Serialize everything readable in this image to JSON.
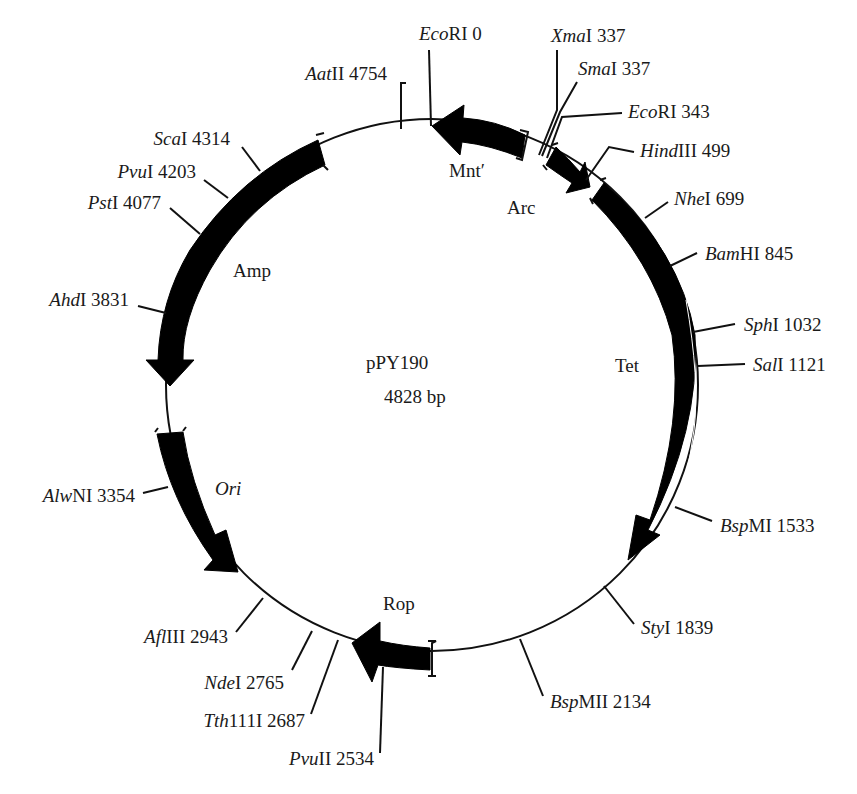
{
  "plasmid": {
    "name": "pPY190",
    "size_label": "4828 bp",
    "size_bp": 4828
  },
  "genes": [
    {
      "name": "Mnt′",
      "italic": false,
      "direction": "counterclockwise"
    },
    {
      "name": "Arc",
      "italic": false,
      "direction": "clockwise"
    },
    {
      "name": "Tet",
      "italic": false,
      "direction": "clockwise"
    },
    {
      "name": "Rop",
      "italic": false,
      "direction": "counterclockwise"
    },
    {
      "name": "Ori",
      "italic": true,
      "direction": "clockwise"
    },
    {
      "name": "Amp",
      "italic": false,
      "direction": "counterclockwise"
    }
  ],
  "sites": [
    {
      "enzyme_italic": "Eco",
      "enzyme_rest": "RI",
      "position": "0"
    },
    {
      "enzyme_italic": "Xma",
      "enzyme_rest": "I",
      "position": "337"
    },
    {
      "enzyme_italic": "Sma",
      "enzyme_rest": "I",
      "position": "337"
    },
    {
      "enzyme_italic": "Eco",
      "enzyme_rest": "RI",
      "position": "343"
    },
    {
      "enzyme_italic": "Hind",
      "enzyme_rest": "III",
      "position": "499"
    },
    {
      "enzyme_italic": "Nhe",
      "enzyme_rest": "I",
      "position": "699"
    },
    {
      "enzyme_italic": "Bam",
      "enzyme_rest": "HI",
      "position": "845"
    },
    {
      "enzyme_italic": "Sph",
      "enzyme_rest": "I",
      "position": "1032"
    },
    {
      "enzyme_italic": "Sal",
      "enzyme_rest": "I",
      "position": "1121"
    },
    {
      "enzyme_italic": "Bsp",
      "enzyme_rest": "MI",
      "position": "1533"
    },
    {
      "enzyme_italic": "Sty",
      "enzyme_rest": "I",
      "position": "1839"
    },
    {
      "enzyme_italic": "Bsp",
      "enzyme_rest": "MII",
      "position": "2134"
    },
    {
      "enzyme_italic": "Pvu",
      "enzyme_rest": "II",
      "position": "2534"
    },
    {
      "enzyme_italic": "Tth",
      "enzyme_rest": "111I",
      "position": "2687"
    },
    {
      "enzyme_italic": "Nde",
      "enzyme_rest": "I",
      "position": "2765"
    },
    {
      "enzyme_italic": "Afl",
      "enzyme_rest": "III",
      "position": "2943"
    },
    {
      "enzyme_italic": "Alw",
      "enzyme_rest": "NI",
      "position": "3354"
    },
    {
      "enzyme_italic": "Ahd",
      "enzyme_rest": "I",
      "position": "3831"
    },
    {
      "enzyme_italic": "Pst",
      "enzyme_rest": "I",
      "position": "4077"
    },
    {
      "enzyme_italic": "Pvu",
      "enzyme_rest": "I",
      "position": "4203"
    },
    {
      "enzyme_italic": "Sca",
      "enzyme_rest": "I",
      "position": "4314"
    },
    {
      "enzyme_italic": "Aat",
      "enzyme_rest": "II",
      "position": "4754"
    }
  ]
}
